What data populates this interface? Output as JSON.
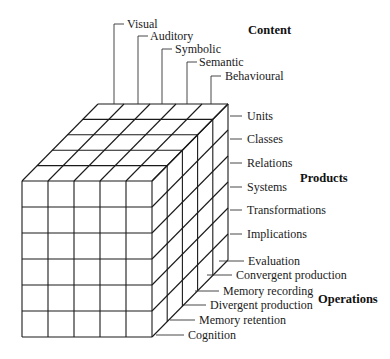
{
  "diagram": {
    "type": "structure-of-intellect-cube",
    "cube": {
      "columns": 5,
      "rows": 6,
      "depth": 5,
      "front_origin": [
        22,
        181
      ],
      "cell_w": 26,
      "cell_h": 26,
      "depth_dx": 15.2,
      "depth_dy": -15.4
    },
    "content": {
      "title": "Content",
      "items": [
        "Visual",
        "Auditory",
        "Symbolic",
        "Semantic",
        "Behavioural"
      ]
    },
    "products": {
      "title": "Products",
      "items": [
        "Units",
        "Classes",
        "Relations",
        "Systems",
        "Transformations",
        "Implications"
      ]
    },
    "operations": {
      "title": "Operations",
      "items": [
        "Evaluation",
        "Convergent production",
        "Memory recording",
        "Divergent production",
        "Memory retention",
        "Cognition"
      ]
    }
  }
}
